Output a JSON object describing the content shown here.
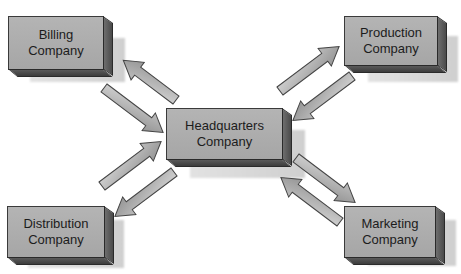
{
  "diagram": {
    "nodes": {
      "billing": {
        "label": "Billing\nCompany"
      },
      "production": {
        "label": "Production\nCompany"
      },
      "headquarters": {
        "label": "Headquarters\nCompany"
      },
      "distribution": {
        "label": "Distribution\nCompany"
      },
      "marketing": {
        "label": "Marketing\nCompany"
      }
    },
    "edges": [
      {
        "from": "headquarters",
        "to": "billing"
      },
      {
        "from": "billing",
        "to": "headquarters"
      },
      {
        "from": "headquarters",
        "to": "production"
      },
      {
        "from": "production",
        "to": "headquarters"
      },
      {
        "from": "distribution",
        "to": "headquarters"
      },
      {
        "from": "headquarters",
        "to": "distribution"
      },
      {
        "from": "headquarters",
        "to": "marketing"
      },
      {
        "from": "marketing",
        "to": "headquarters"
      }
    ],
    "colors": {
      "box_face": "#adadad",
      "box_side": "#5a5a5a",
      "arrow_fill": "#a8a8a8",
      "arrow_stroke": "#444444"
    }
  }
}
